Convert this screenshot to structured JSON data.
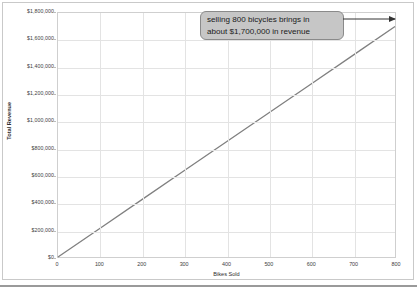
{
  "chart_data": {
    "type": "line",
    "title": "",
    "xlabel": "Bikes Sold",
    "ylabel": "Total Revenue",
    "xlim": [
      0,
      800
    ],
    "ylim": [
      0,
      1800000
    ],
    "grid": true,
    "legend": "none",
    "x_ticks": [
      0,
      100,
      200,
      300,
      400,
      500,
      600,
      700,
      800
    ],
    "x_tick_labels": [
      "0",
      "100",
      "200",
      "300",
      "400",
      "500",
      "600",
      "700",
      "800"
    ],
    "y_ticks": [
      0,
      200000,
      400000,
      600000,
      800000,
      1000000,
      1200000,
      1400000,
      1600000,
      1800000
    ],
    "y_tick_labels": [
      "$0",
      "$200,000",
      "$400,000",
      "$600,000",
      "$800,000",
      "$1,000,000",
      "$1,200,000",
      "$1,400,000",
      "$1,600,000",
      "$1,800,000"
    ],
    "series": [
      {
        "name": "Total Revenue",
        "color": "#808080",
        "x": [
          0,
          100,
          200,
          300,
          400,
          500,
          600,
          700,
          800
        ],
        "values": [
          0,
          212500,
          425000,
          637500,
          850000,
          1062500,
          1275000,
          1487500,
          1700000
        ]
      }
    ],
    "annotations": [
      {
        "name": "revenue-callout",
        "line1": "selling 800 bicycles brings in",
        "line2": "about $1,700,000 in revenue",
        "points_to_x": 800,
        "points_to_y": 1700000,
        "fill": "#c6c6c6",
        "border": "#8a8a8a"
      }
    ]
  },
  "colors": {
    "series_line": "#808080",
    "gridline": "#e3e3e3",
    "plot_border": "#cfcfcf",
    "figure_border": "#c9c9c9",
    "bottom_rule": "#9a9a9a",
    "tick_text": "#3d3d3d",
    "axis_title": "#2d2d2d"
  }
}
